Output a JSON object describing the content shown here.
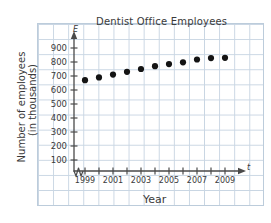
{
  "chart_data": {
    "type": "scatter",
    "title": "Dentist Office Employees",
    "xlabel": "Year",
    "ylabel": "Number of employees",
    "ylabel_line2": "(in thousands)",
    "x_axis_symbol": "t",
    "y_axis_symbol": "E",
    "grid": true,
    "legend": "none",
    "axis_break": true,
    "xlim": [
      1998.4,
      2010.2
    ],
    "ylim": [
      0,
      960
    ],
    "y_ticks": [
      100,
      200,
      300,
      400,
      500,
      600,
      700,
      800,
      900
    ],
    "x_ticks": [
      1999,
      2000,
      2001,
      2002,
      2003,
      2004,
      2005,
      2006,
      2007,
      2008,
      2009
    ],
    "x_tick_labels": [
      "1999",
      "",
      "2001",
      "",
      "2003",
      "",
      "2005",
      "",
      "2007",
      "",
      "2009"
    ],
    "x": [
      1999,
      2000,
      2001,
      2002,
      2003,
      2004,
      2005,
      2006,
      2007,
      2008,
      2009
    ],
    "values": [
      670,
      690,
      710,
      730,
      750,
      770,
      785,
      798,
      818,
      828,
      830
    ],
    "point_color": "#141414",
    "grid_color": "#c9d6e3",
    "axis_color": "#4a4a4a",
    "text_color": "#3a3a3a"
  }
}
